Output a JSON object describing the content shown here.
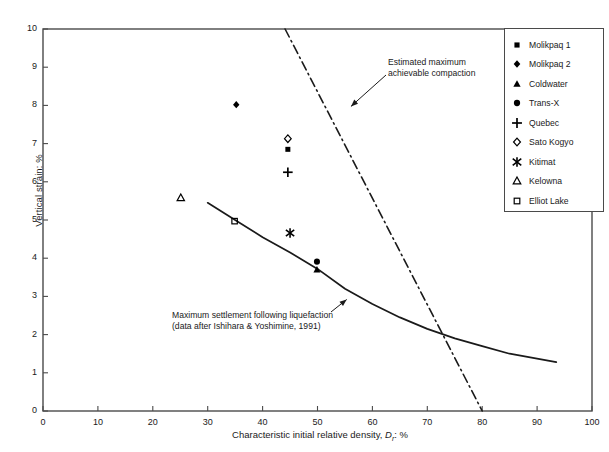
{
  "chart_data": {
    "type": "scatter",
    "title": "",
    "xlabel": "Characteristic initial relative density, D r : %",
    "xlabel_main": "Characteristic initial relative density,",
    "xlabel_sym": "D",
    "xlabel_sub": "r",
    "xlabel_unit": ": %",
    "ylabel": "Vertical strain: %",
    "xlim": [
      0,
      100
    ],
    "ylim": [
      0,
      10
    ],
    "xticks": [
      0,
      10,
      20,
      30,
      40,
      50,
      60,
      70,
      80,
      90,
      100
    ],
    "yticks": [
      0,
      1,
      2,
      3,
      4,
      5,
      6,
      7,
      8,
      9,
      10
    ],
    "xtick_labels": [
      "0",
      "10",
      "20",
      "30",
      "40",
      "50",
      "60",
      "70",
      "80",
      "90",
      "100"
    ],
    "ytick_labels": [
      "0",
      "1",
      "2",
      "3",
      "4",
      "5",
      "6",
      "7",
      "8",
      "9",
      "10"
    ],
    "grid": false,
    "legend_position": "top-right",
    "series": [
      {
        "name": "Molikpaq 1",
        "marker": "filled-square",
        "points": [
          [
            44.6,
            6.85
          ]
        ]
      },
      {
        "name": "Molikpaq 2",
        "marker": "filled-diamond",
        "points": [
          [
            35.2,
            8.02
          ]
        ]
      },
      {
        "name": "Coldwater",
        "marker": "filled-triangle",
        "points": [
          [
            49.9,
            3.7
          ]
        ]
      },
      {
        "name": "Trans-X",
        "marker": "filled-circle",
        "points": [
          [
            49.9,
            3.91
          ]
        ]
      },
      {
        "name": "Quebec",
        "marker": "plus",
        "points": [
          [
            44.6,
            6.25
          ]
        ]
      },
      {
        "name": "Sato Kogyo",
        "marker": "open-diamond",
        "points": [
          [
            44.6,
            7.13
          ]
        ]
      },
      {
        "name": "Kitimat",
        "marker": "asterisk",
        "points": [
          [
            45.0,
            4.66
          ]
        ]
      },
      {
        "name": "Kelowna",
        "marker": "open-triangle",
        "points": [
          [
            25.1,
            5.58
          ]
        ]
      },
      {
        "name": "Elliot Lake",
        "marker": "open-square",
        "points": [
          [
            34.9,
            4.97
          ]
        ]
      }
    ],
    "curves": [
      {
        "name": "Maximum settlement following liquefaction",
        "style": "solid",
        "points": [
          [
            30.0,
            5.45
          ],
          [
            35.0,
            5.0
          ],
          [
            40.0,
            4.55
          ],
          [
            45.0,
            4.15
          ],
          [
            50.0,
            3.72
          ],
          [
            55.0,
            3.2
          ],
          [
            60.0,
            2.8
          ],
          [
            65.0,
            2.45
          ],
          [
            70.0,
            2.15
          ],
          [
            75.0,
            1.9
          ],
          [
            80.0,
            1.7
          ],
          [
            85.0,
            1.5
          ],
          [
            93.5,
            1.28
          ]
        ]
      },
      {
        "name": "Estimated maximum achievable compaction",
        "style": "dash-dot",
        "points": [
          [
            44.1,
            10.0
          ],
          [
            80.0,
            0.0
          ]
        ]
      }
    ],
    "annotations": [
      {
        "name": "estimated-maximum-achievable-compaction",
        "line1": "Estimated maximum",
        "line2": "achievable compaction",
        "arrow_to": [
          55.0,
          8.0
        ]
      },
      {
        "name": "maximum-settlement-following-liquefaction",
        "line1": "Maximum settlement following liquefaction",
        "line2": "(data after Ishihara & Yoshimine, 1991)",
        "arrow_to": [
          55.5,
          3.05
        ]
      }
    ]
  },
  "legend": {
    "items": [
      {
        "label": "Molikpaq 1",
        "marker": "filled-square"
      },
      {
        "label": "Molikpaq 2",
        "marker": "filled-diamond"
      },
      {
        "label": "Coldwater",
        "marker": "filled-triangle"
      },
      {
        "label": "Trans-X",
        "marker": "filled-circle"
      },
      {
        "label": "Quebec",
        "marker": "plus"
      },
      {
        "label": "Sato Kogyo",
        "marker": "open-diamond"
      },
      {
        "label": "Kitimat",
        "marker": "asterisk"
      },
      {
        "label": "Kelowna",
        "marker": "open-triangle"
      },
      {
        "label": "Elliot Lake",
        "marker": "open-square"
      }
    ]
  },
  "colors": {
    "ink": "#1a1a1a",
    "axis": "#4a4a4a",
    "marker": "#000000",
    "background": "#ffffff"
  }
}
